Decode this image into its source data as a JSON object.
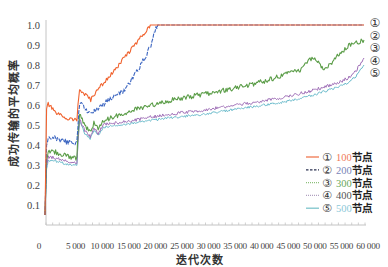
{
  "chart_data": {
    "type": "line",
    "title": "",
    "xlabel": "迭代次数",
    "ylabel": "成功传输的平均概率",
    "xlim": [
      0,
      60000
    ],
    "ylim": [
      0,
      1.0
    ],
    "grid": false,
    "legend_position": "lower right",
    "x_ticks": [
      0,
      5000,
      10000,
      15000,
      20000,
      25000,
      30000,
      35000,
      40000,
      45000,
      50000,
      55000,
      60000
    ],
    "x_tick_labels": [
      "0",
      "5 000",
      "10 000",
      "15 000",
      "20 000",
      "25 000",
      "30 000",
      "35 000",
      "40 000",
      "45 000",
      "50 000",
      "55 000",
      "60 000"
    ],
    "y_ticks": [
      0.1,
      0.2,
      0.3,
      0.4,
      0.5,
      0.6,
      0.7,
      0.8,
      0.9,
      1.0
    ],
    "y_tick_labels": [
      "0.1",
      "0.2",
      "0.3",
      "0.4",
      "0.5",
      "0.6",
      "0.7",
      "0.8",
      "0.9",
      "1.0"
    ],
    "series": [
      {
        "name": "100节点",
        "marker": "①",
        "nodes": "100",
        "suffix": "节点",
        "color": "#f0632f",
        "label_color": "#f07a5a",
        "legend_color": "#f0784f",
        "style": "solid",
        "x": [
          0,
          300,
          600,
          2000,
          4000,
          6000,
          6200,
          6500,
          8000,
          8600,
          9400,
          11000,
          13200,
          15000,
          16900,
          18800,
          19800,
          60000
        ],
        "values": [
          0.05,
          0.58,
          0.605,
          0.56,
          0.535,
          0.525,
          0.6,
          0.675,
          0.64,
          0.625,
          0.66,
          0.71,
          0.775,
          0.84,
          0.9,
          0.965,
          1.0,
          1.0
        ]
      },
      {
        "name": "200节点",
        "marker": "②",
        "nodes": "200",
        "suffix": "节点",
        "color": "#3a64c0",
        "label_color": "#7a86b8",
        "legend_color": "#2a3050",
        "style": "dashed",
        "x": [
          0,
          300,
          600,
          2000,
          4000,
          6000,
          6200,
          6500,
          8500,
          10000,
          11300,
          13000,
          15000,
          16000,
          16900,
          18000,
          18800,
          20100,
          20700,
          21200,
          60000
        ],
        "values": [
          0.05,
          0.4,
          0.445,
          0.435,
          0.415,
          0.41,
          0.5,
          0.61,
          0.555,
          0.58,
          0.61,
          0.64,
          0.67,
          0.71,
          0.76,
          0.8,
          0.84,
          0.91,
          0.975,
          1.0,
          1.0
        ]
      },
      {
        "name": "300节点",
        "marker": "③",
        "nodes": "300",
        "suffix": "节点",
        "color": "#5b9d48",
        "label_color": "#6aa85a",
        "legend_color": "#8cc07a",
        "style": "dotted",
        "x": [
          0,
          300,
          600,
          2000,
          4000,
          6000,
          6200,
          6500,
          7500,
          8500,
          9200,
          10000,
          11000,
          12000,
          14000,
          16000,
          20000,
          24000,
          29000,
          33000,
          38500,
          42000,
          45000,
          48000,
          50400,
          52300,
          53600,
          55500,
          57300,
          60000
        ],
        "values": [
          0.05,
          0.33,
          0.37,
          0.365,
          0.345,
          0.335,
          0.45,
          0.55,
          0.5,
          0.465,
          0.51,
          0.48,
          0.52,
          0.53,
          0.55,
          0.57,
          0.6,
          0.625,
          0.65,
          0.67,
          0.7,
          0.725,
          0.75,
          0.775,
          0.84,
          0.785,
          0.8,
          0.86,
          0.9,
          0.925
        ]
      },
      {
        "name": "400节点",
        "marker": "④",
        "nodes": "400",
        "suffix": "节点",
        "color": "#a070b8",
        "label_color": "#555555",
        "legend_color": "#b0a0c0",
        "style": "dotted",
        "x": [
          0,
          300,
          600,
          2000,
          4000,
          6000,
          6200,
          6500,
          7500,
          8500,
          9200,
          10000,
          11000,
          12000,
          15000,
          20000,
          25000,
          30000,
          35000,
          40000,
          45000,
          50000,
          55000,
          57000,
          58500,
          60000
        ],
        "values": [
          0.05,
          0.3,
          0.34,
          0.335,
          0.32,
          0.31,
          0.42,
          0.53,
          0.47,
          0.44,
          0.49,
          0.46,
          0.5,
          0.505,
          0.515,
          0.54,
          0.56,
          0.575,
          0.595,
          0.615,
          0.64,
          0.67,
          0.71,
          0.735,
          0.77,
          0.835
        ]
      },
      {
        "name": "500节点",
        "marker": "⑤",
        "nodes": "500",
        "suffix": "节点",
        "color": "#6cbccc",
        "label_color": "#8cc8d8",
        "legend_color": "#7ec4cc",
        "style": "solid",
        "x": [
          0,
          300,
          600,
          2000,
          4000,
          6000,
          6200,
          6500,
          7500,
          8500,
          9200,
          10000,
          11000,
          12000,
          15000,
          20000,
          25000,
          30000,
          35000,
          40000,
          45000,
          50000,
          55000,
          57000,
          58500,
          60000
        ],
        "values": [
          0.05,
          0.28,
          0.32,
          0.32,
          0.305,
          0.3,
          0.41,
          0.52,
          0.455,
          0.43,
          0.475,
          0.45,
          0.49,
          0.495,
          0.5,
          0.525,
          0.54,
          0.555,
          0.575,
          0.595,
          0.615,
          0.645,
          0.69,
          0.71,
          0.745,
          0.8
        ]
      }
    ]
  }
}
